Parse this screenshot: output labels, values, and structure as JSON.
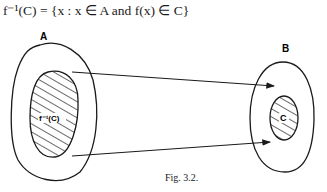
{
  "formula": {
    "lhs": "f⁻¹(C)",
    "rhs": " = {x : x ∈ A and f(x) ∈ C}"
  },
  "diagram": {
    "set_a_label": "A",
    "set_b_label": "B",
    "preimage_label": "f⁻¹(C)",
    "subset_label": "C"
  },
  "caption": "Fig. 3.2."
}
